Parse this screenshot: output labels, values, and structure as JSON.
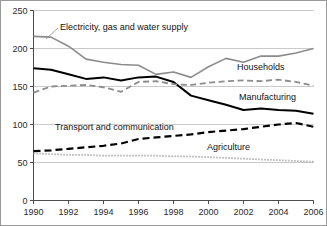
{
  "chart_data": {
    "type": "line",
    "title": "",
    "subtitle": "",
    "xlabel": "",
    "ylabel": "",
    "xlim": [
      1990,
      2006
    ],
    "ylim": [
      0,
      250
    ],
    "grid": true,
    "legend_position": "inline-annotations",
    "x": [
      1990,
      1991,
      1992,
      1993,
      1994,
      1995,
      1996,
      1997,
      1998,
      1999,
      2000,
      2001,
      2002,
      2003,
      2004,
      2005,
      2006
    ],
    "xticks": [
      "1990",
      "1992",
      "1994",
      "1996",
      "1998",
      "2000",
      "2002",
      "2004",
      "2006"
    ],
    "yticks": [
      "0",
      "50",
      "100",
      "150",
      "200",
      "250"
    ],
    "series": [
      {
        "name": "Electricity, gas and water supply",
        "style": "solid",
        "color": "#8c8c8c",
        "width": 1.6,
        "values": [
          216,
          215,
          203,
          186,
          182,
          179,
          178,
          166,
          169,
          162,
          176,
          187,
          182,
          190,
          190,
          194,
          200
        ]
      },
      {
        "name": "Manufacturing",
        "style": "solid",
        "color": "#000000",
        "width": 2.0,
        "values": [
          174,
          172,
          166,
          160,
          162,
          158,
          162,
          163,
          156,
          138,
          132,
          126,
          119,
          121,
          119,
          118,
          114
        ]
      },
      {
        "name": "Households",
        "style": "dashed",
        "color": "#8c8c8c",
        "width": 1.8,
        "values": [
          142,
          150,
          151,
          152,
          149,
          143,
          156,
          157,
          153,
          152,
          155,
          157,
          158,
          157,
          159,
          156,
          151
        ]
      },
      {
        "name": "Transport and communication",
        "style": "dashed",
        "color": "#000000",
        "width": 2.2,
        "values": [
          65,
          66,
          68,
          70,
          72,
          75,
          81,
          83,
          85,
          87,
          90,
          92,
          94,
          97,
          100,
          102,
          97
        ]
      },
      {
        "name": "Agriculture",
        "style": "dotted",
        "color": "#9a9a9a",
        "width": 1.8,
        "values": [
          62,
          61,
          60,
          60,
          59,
          59,
          59,
          59,
          58,
          58,
          57,
          56,
          55,
          54,
          53,
          52,
          51
        ]
      }
    ],
    "annotations": [
      {
        "text": "Electricity, gas and water supply",
        "x": 60,
        "y": 30
      },
      {
        "text": "Households",
        "x": 237,
        "y": 70
      },
      {
        "text": "Manufacturing",
        "x": 239,
        "y": 100
      },
      {
        "text": "Transport and communication",
        "x": 55,
        "y": 130
      },
      {
        "text": "Agriculture",
        "x": 207,
        "y": 150
      }
    ]
  }
}
